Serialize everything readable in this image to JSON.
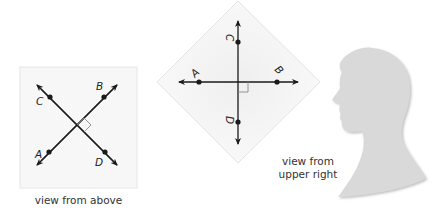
{
  "figure": {
    "panels": [
      {
        "id": "view-above",
        "caption": "view from above",
        "points": {
          "A": "A",
          "B": "B",
          "C": "C",
          "D": "D"
        },
        "lines": [
          "AB",
          "CD"
        ],
        "right_angle": true
      },
      {
        "id": "view-upper-right",
        "caption_line1": "view from",
        "caption_line2": "upper right",
        "points": {
          "A": "A",
          "B": "B",
          "C": "C",
          "D": "D"
        },
        "lines": [
          "AB",
          "CD"
        ],
        "right_angle": true
      },
      {
        "id": "silhouette",
        "description": "profile silhouette of a head facing left"
      }
    ],
    "colors": {
      "line": "#1a1a1a",
      "paper": "#f7f7f7",
      "paper_shadow": "#e2e2e2",
      "silhouette": "#d9d9d9",
      "right_angle": "#888888"
    }
  }
}
